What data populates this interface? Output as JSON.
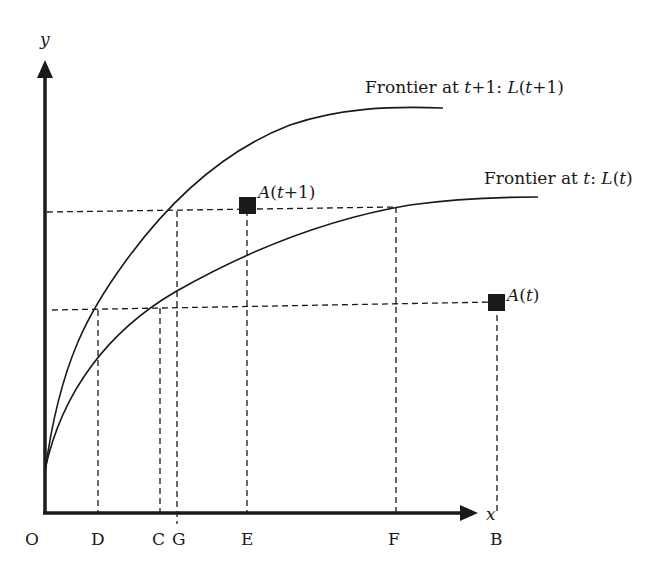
{
  "diagram": {
    "type": "production-frontier-shift",
    "axes": {
      "x_label": "x",
      "y_label": "y",
      "origin_label": "O"
    },
    "x_ticks": [
      {
        "id": "D",
        "label": "D"
      },
      {
        "id": "C",
        "label": "C"
      },
      {
        "id": "G",
        "label": "G"
      },
      {
        "id": "E",
        "label": "E"
      },
      {
        "id": "F",
        "label": "F"
      },
      {
        "id": "B",
        "label": "B"
      }
    ],
    "curves": [
      {
        "id": "frontier_t1",
        "label_prefix": "Frontier at ",
        "label_var": "t",
        "label_mid": "+1: ",
        "label_fn": "L",
        "label_arg_open": "(",
        "label_arg": "t",
        "label_arg_rest": "+1)"
      },
      {
        "id": "frontier_t",
        "label_prefix": "Frontier at ",
        "label_var": "t",
        "label_mid": ": ",
        "label_fn": "L",
        "label_arg_open": "(",
        "label_arg": "t",
        "label_arg_rest": ")"
      }
    ],
    "points": [
      {
        "id": "A_t1",
        "label_fn": "A",
        "label_open": "(",
        "label_var": "t",
        "label_rest": "+1)"
      },
      {
        "id": "A_t",
        "label_fn": "A",
        "label_open": "(",
        "label_var": "t",
        "label_rest": ")"
      }
    ],
    "colors": {
      "ink": "#1a1a1a",
      "background": "#ffffff"
    }
  }
}
